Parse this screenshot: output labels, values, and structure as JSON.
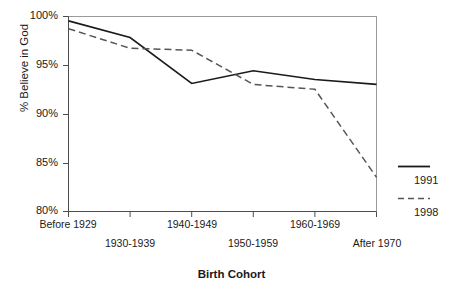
{
  "chart_data": {
    "type": "line",
    "title": "",
    "xlabel": "Birth Cohort",
    "ylabel": "% Believe in God",
    "categories": [
      "Before 1929",
      "1930-1939",
      "1940-1949",
      "1950-1959",
      "1960-1969",
      "After 1970"
    ],
    "ylim": [
      80,
      100
    ],
    "yticks": [
      "80%",
      "85%",
      "90%",
      "95%",
      "100%"
    ],
    "ytick_values": [
      80,
      85,
      90,
      95,
      100
    ],
    "grid": false,
    "legend_position": "right",
    "series": [
      {
        "name": "1991",
        "style": "solid",
        "color": "#1a1a1a",
        "values": [
          99.5,
          97.8,
          93.1,
          94.4,
          93.5,
          93.0
        ]
      },
      {
        "name": "1998",
        "style": "dashed",
        "color": "#555555",
        "values": [
          98.7,
          96.7,
          96.5,
          93.0,
          92.5,
          83.5
        ]
      }
    ]
  },
  "axis": {
    "y_title": "% Believe in God",
    "x_title": "Birth Cohort"
  },
  "legend": {
    "items": [
      {
        "label": "1991",
        "style": "solid"
      },
      {
        "label": "1998",
        "style": "dashed"
      }
    ]
  }
}
